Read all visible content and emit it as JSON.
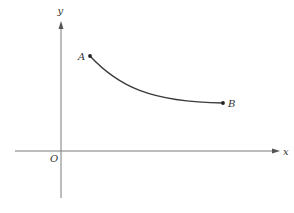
{
  "diagram": {
    "type": "coordinate-curve",
    "axes": {
      "x_label": "x",
      "y_label": "y",
      "origin_label": "O"
    },
    "points": [
      {
        "id": "A",
        "label": "A",
        "description": "start point of curve, upper left"
      },
      {
        "id": "B",
        "label": "B",
        "description": "end point of curve, lower right"
      }
    ],
    "curve": {
      "description": "smooth decreasing concave-up curve from A to B",
      "from": "A",
      "to": "B"
    },
    "colors": {
      "axis": "#7a7a7a",
      "curve": "#3a3a3a",
      "background": "#ffffff"
    }
  }
}
